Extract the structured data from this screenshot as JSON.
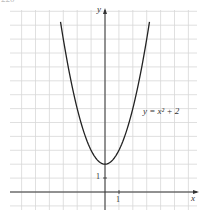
{
  "page_number": "220",
  "chart_data": {
    "type": "line",
    "title": "",
    "xlabel": "x",
    "ylabel": "y",
    "series": [
      {
        "name": "y = x^2 + 2",
        "function": "x^2 + 2",
        "x": [
          -3.2,
          -3,
          -2.5,
          -2,
          -1.5,
          -1,
          -0.5,
          0,
          0.5,
          1,
          1.5,
          2,
          2.5,
          3,
          3.2
        ],
        "values": [
          12.24,
          11,
          8.25,
          6,
          4.25,
          3,
          2.25,
          2,
          2.25,
          3,
          4.25,
          6,
          8.25,
          11,
          12.24
        ]
      }
    ],
    "annotations": [
      {
        "text": "y = x² + 2",
        "x": 2.3,
        "y": 5.5
      }
    ],
    "tick_labels": {
      "x": [
        "1"
      ],
      "y": [
        "1"
      ]
    },
    "xlim": [
      -7,
      7
    ],
    "ylim": [
      -1,
      13
    ],
    "grid": true,
    "legend": "none",
    "colors": {
      "curve": "#222222",
      "axes": "#333333",
      "grid": "#d8d8d8"
    }
  },
  "labels": {
    "x_axis": "x",
    "y_axis": "y",
    "curve": "y = x² + 2",
    "x_tick": "1",
    "y_tick": "1"
  }
}
